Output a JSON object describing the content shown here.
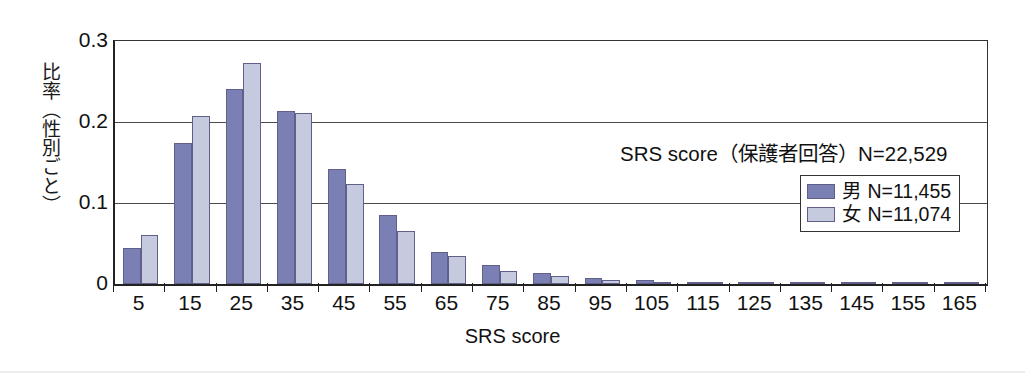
{
  "chart_data": {
    "type": "bar",
    "title": "",
    "xlabel": "SRS score",
    "ylabel": "比率（性別ごと）",
    "categories": [
      "5",
      "15",
      "25",
      "35",
      "45",
      "55",
      "65",
      "75",
      "85",
      "95",
      "105",
      "115",
      "125",
      "135",
      "145",
      "155",
      "165"
    ],
    "series": [
      {
        "name": "男 N=11,455",
        "short_name": "男",
        "color": "#7a7fb4",
        "values": [
          0.045,
          0.174,
          0.241,
          0.213,
          0.142,
          0.085,
          0.039,
          0.023,
          0.013,
          0.008,
          0.005,
          0.003,
          0.003,
          0.002,
          0.002,
          0.002,
          0.001
        ]
      },
      {
        "name": "女 N=11,074",
        "short_name": "女",
        "color": "#c6cadf",
        "values": [
          0.06,
          0.207,
          0.273,
          0.211,
          0.124,
          0.065,
          0.034,
          0.016,
          0.01,
          0.005,
          0.003,
          0.002,
          0.002,
          0.001,
          0.001,
          0.001,
          0.001
        ]
      }
    ],
    "ylim": [
      0,
      0.3
    ],
    "yticks": [
      0,
      0.1,
      0.2,
      0.3
    ],
    "ytick_labels": [
      "0",
      "0.1",
      "0.2",
      "0.3"
    ],
    "grid": true,
    "legend_position": "inside-right",
    "annotation": "SRS score（保護者回答）N=22,529"
  },
  "axes": {
    "y_title": "比率（性別ごと）",
    "x_title": "SRS score",
    "y_tick_labels": [
      "0.3",
      "0.2",
      "0.1",
      "0"
    ],
    "x_tick_labels": [
      "5",
      "15",
      "25",
      "35",
      "45",
      "55",
      "65",
      "75",
      "85",
      "95",
      "105",
      "115",
      "125",
      "135",
      "145",
      "155",
      "165"
    ]
  },
  "annotation": {
    "text": "SRS score（保護者回答）N=22,529"
  },
  "legend": {
    "entries": [
      {
        "label": "男 N=11,455",
        "color": "#7a7fb4",
        "swatch_name": "male-color-swatch"
      },
      {
        "label": "女 N=11,074",
        "color": "#c6cadf",
        "swatch_name": "female-color-swatch"
      }
    ]
  },
  "colors": {
    "male_bar": "#7a7fb4",
    "female_bar": "#c6cadf",
    "bar_outline": "#60608a",
    "axis": "#222222",
    "gridline": "#4a4a4a",
    "background": "#ffffff"
  }
}
